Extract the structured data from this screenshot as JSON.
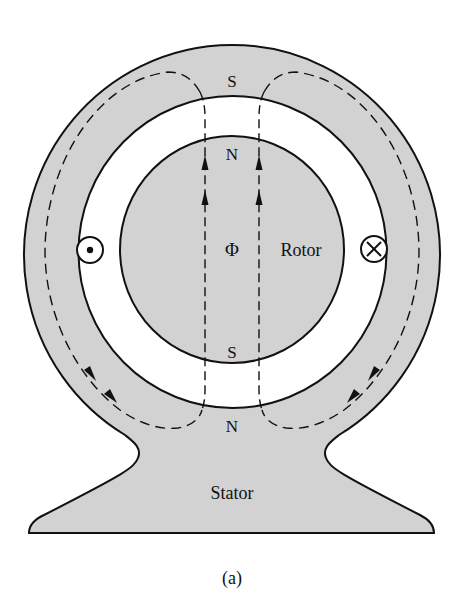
{
  "figure": {
    "caption": "(a)",
    "fill_color": "#d2d2d2",
    "stroke_color": "#111111",
    "background": "#ffffff"
  },
  "labels": {
    "stator_pole_top": "S",
    "rotor_pole_top": "N",
    "rotor_pole_bottom": "S",
    "stator_pole_bottom": "N",
    "flux_symbol": "Φ",
    "rotor": "Rotor",
    "stator": "Stator"
  },
  "conductors": {
    "left": {
      "symbol": "dot",
      "meaning": "current out of page"
    },
    "right": {
      "symbol": "cross",
      "meaning": "current into page"
    }
  },
  "flux": {
    "center_direction": "up",
    "return_path_direction": "down-around-stator"
  }
}
